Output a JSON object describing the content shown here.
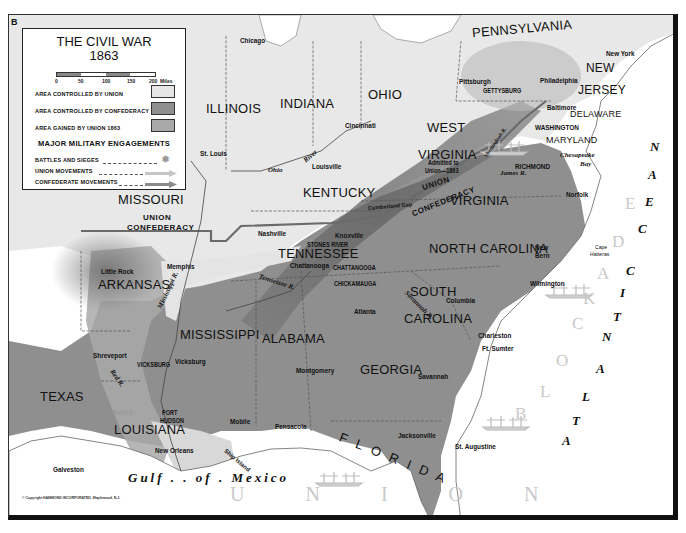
{
  "map": {
    "corner_letter": "B",
    "title": "THE CIVIL WAR",
    "year": "1863",
    "copyright": "© Copyright HAMMOND INCORPORATED, Maplewood, N.J.",
    "colors": {
      "union": "#e6e6e6",
      "confederacy": "#8f8f8f",
      "gained_by_union": "#a9a9a9",
      "water": "#ffffff",
      "border": "#555555"
    }
  },
  "legend": {
    "scale": {
      "ticks": [
        "0",
        "50",
        "100",
        "150",
        "200"
      ],
      "unit": "Miles"
    },
    "areas": [
      {
        "label": "AREA CONTROLLED BY UNION",
        "color": "#e6e6e6"
      },
      {
        "label": "AREA CONTROLLED BY CONFEDERACY",
        "color": "#8f8f8f"
      },
      {
        "label": "AREA GAINED BY UNION 1863",
        "color": "#a9a9a9"
      }
    ],
    "engagements_heading": "MAJOR MILITARY ENGAGEMENTS",
    "symbols": [
      {
        "label": "BATTLES AND SIEGES",
        "icon": "battle-burst-icon"
      },
      {
        "label": "UNION MOVEMENTS",
        "icon": "union-arrow-icon"
      },
      {
        "label": "CONFEDERATE MOVEMENTS",
        "icon": "confederate-arrow-icon"
      }
    ]
  },
  "states": {
    "pennsylvania": "PENNSYLVANIA",
    "new": "NEW",
    "jersey": "JERSEY",
    "delaware": "DELAWARE",
    "maryland": "MARYLAND",
    "illinois": "ILLINOIS",
    "indiana": "INDIANA",
    "ohio": "OHIO",
    "west": "WEST",
    "wv_virginia": "VIRGINIA",
    "wv_note_1": "Admitted to",
    "wv_note_2": "Union—1863",
    "virginia": "VIRGINIA",
    "kentucky": "KENTUCKY",
    "missouri": "MISSOURI",
    "tennessee": "TENNESSEE",
    "north_carolina": "NORTH CAROLINA",
    "arkansas": "ARKANSAS",
    "south": "SOUTH",
    "carolina": "CAROLINA",
    "mississippi": "MISSISSIPPI",
    "alabama": "ALABAMA",
    "georgia": "GEORGIA",
    "texas": "TEXAS",
    "louisiana": "LOUISIANA",
    "florida": "F L O R I D A"
  },
  "cities": {
    "chicago": "Chicago",
    "pittsburgh": "Pittsburgh",
    "philadelphia": "Philadelphia",
    "new_york": "New York",
    "baltimore": "Baltimore",
    "washington": "WASHINGTON",
    "cincinnati": "Cincinnati",
    "st_louis": "St. Louis",
    "louisville": "Louisville",
    "richmond": "RICHMOND",
    "norfolk": "Norfolk",
    "nashville": "Nashville",
    "knoxville": "Knoxville",
    "chattanooga": "Chattanooga",
    "memphis": "Memphis",
    "little_rock": "Little Rock",
    "new_bern_1": "New",
    "new_bern_2": "Bern",
    "wilmington": "Wilmington",
    "columbia": "Columbia",
    "atlanta": "Atlanta",
    "charleston": "Charleston",
    "ft_sumter": "Ft. Sumter",
    "shreveport": "Shreveport",
    "vicksburg": "Vicksburg",
    "montgomery": "Montgomery",
    "savannah": "Savannah",
    "mobile": "Mobile",
    "pensacola": "Pensacola",
    "jacksonville": "Jacksonville",
    "st_augustine": "St. Augustine",
    "new_orleans": "New Orleans",
    "galveston": "Galveston"
  },
  "battles": {
    "gettysburg": "GETTYSBURG",
    "stones_river": "STONES RIVER",
    "chattanooga": "CHATTANOOGA",
    "chickamauga": "CHICKAMAUGA",
    "vicksburg": "VICKSBURG",
    "port_hudson_1": "PORT",
    "port_hudson_2": "HUDSON",
    "banks": "BANKS"
  },
  "features": {
    "ohio_river": "Ohio",
    "river_word": "River",
    "mississippi_r": "Mississippi R.",
    "tennessee_r": "Tennessee R.",
    "red_r": "Red R.",
    "savannah_r": "Savannah R.",
    "james_r": "James R.",
    "shenandoah": "Shenandoah R.",
    "chesapeake_1": "Chesapeake",
    "chesapeake_2": "Bay",
    "cape_hatteras_1": "Cape",
    "cape_hatteras_2": "Hatteras",
    "cumberland_gap": "Cumberland Gap",
    "ship_island": "Ship Island",
    "gulf": "Gulf . . of . Mexico",
    "atlantic": [
      "A",
      "T",
      "L",
      "A",
      "N",
      "T",
      "I",
      "C",
      "O",
      "C",
      "E",
      "A",
      "N"
    ],
    "blockade_east": [
      "B",
      "L",
      "O",
      "C",
      "K",
      "A",
      "D",
      "E"
    ],
    "blockade_gulf": "U  N  I  O  N"
  },
  "lines": {
    "union_1": "UNION",
    "confederacy_1": "CONFEDERACY",
    "union_2": "UNION",
    "confederacy_2": "CONFEDERACY"
  }
}
